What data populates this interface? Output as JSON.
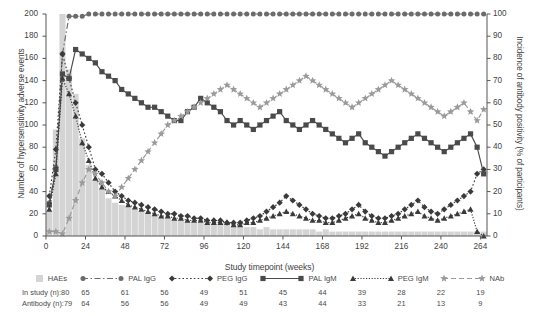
{
  "chart_data": {
    "type": "line",
    "title": "",
    "xlabel": "Study timepoint (weeks)",
    "ylabel_left": "Number of hypersensitivity adverse events",
    "ylabel_right": "Incidence of antibody positivity (% of participants)",
    "xlim": [
      0,
      268
    ],
    "xticks": [
      0,
      24,
      48,
      72,
      96,
      120,
      144,
      168,
      192,
      216,
      240,
      264
    ],
    "ylim_left": [
      0,
      200
    ],
    "yticks_left": [
      0,
      20,
      40,
      60,
      80,
      100,
      120,
      140,
      160,
      180,
      200
    ],
    "ylim_right": [
      0,
      100
    ],
    "yticks_right": [
      0,
      10,
      20,
      30,
      40,
      50,
      60,
      70,
      80,
      90,
      100
    ],
    "grid": false,
    "legend_position": "below-axis",
    "x": [
      2,
      6,
      10,
      14,
      18,
      22,
      26,
      30,
      34,
      38,
      42,
      46,
      50,
      54,
      58,
      62,
      66,
      70,
      74,
      78,
      82,
      86,
      90,
      94,
      98,
      102,
      106,
      110,
      114,
      118,
      122,
      126,
      130,
      134,
      138,
      142,
      146,
      150,
      154,
      158,
      162,
      166,
      170,
      174,
      178,
      182,
      186,
      190,
      194,
      198,
      202,
      206,
      210,
      214,
      218,
      222,
      226,
      230,
      234,
      238,
      242,
      246,
      250,
      254,
      258,
      262,
      266
    ],
    "series": [
      {
        "name": "HAEs",
        "axis": "left",
        "type": "bar",
        "color": "#d4d4d4",
        "values": [
          22,
          96,
          202,
          150,
          128,
          88,
          64,
          50,
          42,
          34,
          30,
          28,
          26,
          24,
          22,
          20,
          18,
          16,
          16,
          14,
          14,
          12,
          12,
          12,
          10,
          10,
          10,
          10,
          8,
          8,
          8,
          8,
          6,
          8,
          6,
          6,
          6,
          6,
          6,
          6,
          6,
          4,
          6,
          4,
          4,
          4,
          4,
          4,
          4,
          4,
          4,
          4,
          4,
          4,
          4,
          4,
          4,
          4,
          4,
          4,
          4,
          4,
          4,
          4,
          4,
          4,
          4
        ]
      },
      {
        "name": "PAL IgG",
        "axis": "right",
        "type": "line",
        "color": "#6b6b6b",
        "marker": "circle",
        "dash": "dashdot",
        "values": [
          15,
          31,
          82,
          99,
          99,
          99,
          100,
          100,
          100,
          100,
          100,
          100,
          100,
          100,
          100,
          100,
          100,
          100,
          100,
          100,
          100,
          100,
          100,
          100,
          100,
          100,
          100,
          100,
          100,
          100,
          100,
          100,
          100,
          100,
          100,
          100,
          100,
          100,
          100,
          100,
          100,
          100,
          100,
          100,
          100,
          100,
          100,
          100,
          100,
          100,
          100,
          100,
          100,
          100,
          100,
          100,
          100,
          100,
          100,
          100,
          100,
          100,
          100,
          100,
          100,
          100,
          100
        ]
      },
      {
        "name": "PEG IgG",
        "axis": "right",
        "type": "line",
        "color": "#3a3a3a",
        "marker": "diamond",
        "dash": "dotted",
        "values": [
          18,
          39,
          82,
          71,
          60,
          50,
          40,
          30,
          28,
          24,
          20,
          18,
          16,
          15,
          14,
          13,
          12,
          11,
          10,
          10,
          9,
          9,
          8,
          8,
          7,
          7,
          7,
          6,
          6,
          6,
          7,
          8,
          9,
          11,
          13,
          15,
          18,
          16,
          14,
          12,
          10,
          9,
          8,
          8,
          9,
          10,
          12,
          14,
          11,
          9,
          8,
          8,
          9,
          10,
          12,
          14,
          16,
          13,
          11,
          10,
          12,
          14,
          16,
          18,
          20,
          28,
          30
        ]
      },
      {
        "name": "PAL IgM",
        "axis": "right",
        "type": "line",
        "color": "#4a4a4a",
        "marker": "square",
        "dash": "solid",
        "values": [
          14,
          30,
          73,
          71,
          84,
          82,
          80,
          78,
          74,
          72,
          70,
          66,
          64,
          62,
          60,
          58,
          58,
          56,
          54,
          52,
          52,
          56,
          58,
          62,
          60,
          58,
          56,
          52,
          50,
          52,
          50,
          48,
          50,
          52,
          54,
          56,
          52,
          50,
          48,
          50,
          52,
          50,
          48,
          46,
          44,
          42,
          44,
          46,
          42,
          40,
          38,
          36,
          38,
          40,
          42,
          44,
          46,
          44,
          42,
          40,
          38,
          40,
          42,
          44,
          46,
          40,
          28
        ]
      },
      {
        "name": "PEG IgM",
        "axis": "right",
        "type": "line",
        "color": "#3a3a3a",
        "marker": "triangle",
        "dash": "densedot",
        "values": [
          12,
          28,
          71,
          64,
          54,
          42,
          34,
          26,
          22,
          20,
          18,
          16,
          14,
          13,
          12,
          11,
          10,
          9,
          9,
          8,
          8,
          7,
          7,
          7,
          6,
          6,
          6,
          6,
          5,
          5,
          6,
          6,
          7,
          8,
          9,
          10,
          11,
          10,
          9,
          8,
          7,
          7,
          6,
          6,
          7,
          8,
          9,
          10,
          8,
          7,
          6,
          6,
          7,
          8,
          9,
          10,
          11,
          9,
          8,
          7,
          8,
          9,
          10,
          11,
          12,
          2,
          0
        ]
      },
      {
        "name": "NAb",
        "axis": "right",
        "type": "line",
        "color": "#9a9a9a",
        "marker": "star",
        "dash": "dashed",
        "values": [
          2,
          2,
          1,
          8,
          16,
          24,
          30,
          28,
          24,
          20,
          18,
          22,
          26,
          30,
          34,
          38,
          42,
          46,
          50,
          52,
          54,
          56,
          58,
          60,
          62,
          64,
          66,
          68,
          66,
          64,
          62,
          60,
          58,
          60,
          62,
          64,
          66,
          68,
          70,
          72,
          70,
          68,
          66,
          64,
          62,
          60,
          58,
          60,
          62,
          64,
          66,
          68,
          70,
          68,
          66,
          64,
          62,
          60,
          58,
          56,
          54,
          56,
          58,
          60,
          56,
          52,
          57
        ]
      }
    ],
    "sample_table": {
      "rows": [
        {
          "label": "In study (n):",
          "first": "80",
          "values": [
            "65",
            "61",
            "56",
            "49",
            "51",
            "45",
            "44",
            "39",
            "28",
            "22",
            "19"
          ]
        },
        {
          "label": "Antibody (n):",
          "first": "79",
          "values": [
            "64",
            "56",
            "56",
            "49",
            "49",
            "43",
            "44",
            "33",
            "21",
            "13",
            "9"
          ]
        }
      ]
    }
  },
  "legend": {
    "items": [
      {
        "label": "HAEs",
        "marker": "bar-swatch",
        "color": "#d4d4d4"
      },
      {
        "label": "PAL IgG",
        "marker": "circle-icon",
        "color": "#6b6b6b"
      },
      {
        "label": "PEG IgG",
        "marker": "diamond-icon",
        "color": "#3a3a3a"
      },
      {
        "label": "PAL IgM",
        "marker": "square-icon",
        "color": "#4a4a4a"
      },
      {
        "label": "PEG IgM",
        "marker": "triangle-icon",
        "color": "#3a3a3a"
      },
      {
        "label": "NAb",
        "marker": "star-icon",
        "color": "#9a9a9a"
      }
    ]
  }
}
